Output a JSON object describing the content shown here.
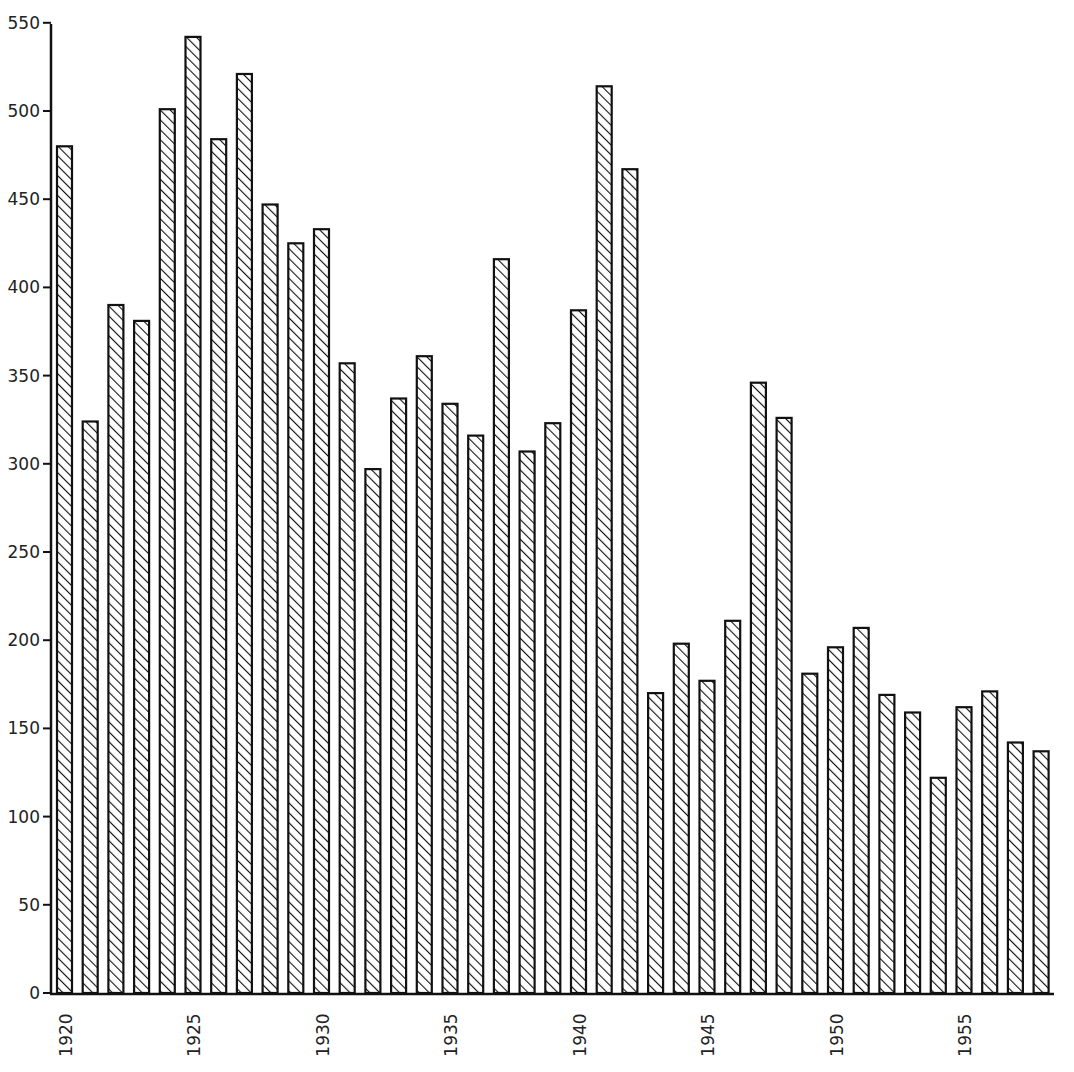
{
  "chart_data": {
    "type": "bar",
    "title": "",
    "xlabel": "",
    "ylabel": "",
    "ylim": [
      0,
      550
    ],
    "yticks": [
      0,
      50,
      100,
      150,
      200,
      250,
      300,
      350,
      400,
      450,
      500,
      550
    ],
    "xtick_labels": [
      "1920",
      "1925",
      "1930",
      "1935",
      "1940",
      "1945",
      "1950",
      "1955"
    ],
    "grid": false,
    "legend": null,
    "bar_style": "diagonal-hatch",
    "categories": [
      1920,
      1921,
      1922,
      1923,
      1924,
      1925,
      1926,
      1927,
      1928,
      1929,
      1930,
      1931,
      1932,
      1933,
      1934,
      1935,
      1936,
      1937,
      1938,
      1939,
      1940,
      1941,
      1942,
      1943,
      1944,
      1945,
      1946,
      1947,
      1948,
      1949,
      1950,
      1951,
      1952,
      1953,
      1954,
      1955,
      1956,
      1957,
      1958
    ],
    "values": [
      480,
      324,
      390,
      381,
      501,
      542,
      484,
      521,
      447,
      425,
      433,
      357,
      297,
      337,
      361,
      334,
      316,
      416,
      307,
      323,
      387,
      514,
      467,
      170,
      198,
      177,
      211,
      346,
      326,
      181,
      196,
      207,
      169,
      159,
      122,
      162,
      171,
      142,
      137
    ]
  }
}
